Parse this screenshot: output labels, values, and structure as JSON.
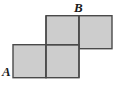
{
  "figure": {
    "kind": "geometry-diagram",
    "background_color": "#ffffff",
    "square_fill_color": "#cdcdcd",
    "square_stroke_color": "#4a4a4a",
    "inner_line_color": "#4a4a4a",
    "stroke_width": 1.4,
    "grid": {
      "cell_size": 33,
      "origin_x": 13,
      "origin_y": 15
    },
    "squares": [
      {
        "name": "top-left-square",
        "col": 1,
        "row": 0
      },
      {
        "name": "top-right-square",
        "col": 2,
        "row": 0
      },
      {
        "name": "bottom-left-square",
        "col": 0,
        "row": 1
      },
      {
        "name": "bottom-right-square",
        "col": 1,
        "row": 1
      }
    ],
    "labels": [
      {
        "id": "A",
        "text": "A",
        "x": 2,
        "y": 65,
        "anchor": "bottom-left-corner"
      },
      {
        "id": "B",
        "text": "B",
        "x": 74,
        "y": 1,
        "anchor": "top-middle-vertex"
      }
    ]
  }
}
